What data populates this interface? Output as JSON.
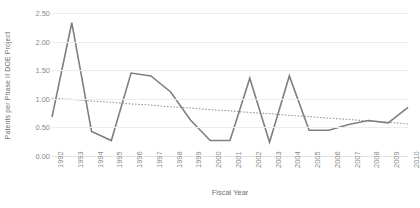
{
  "chart_data": {
    "type": "line",
    "title": "",
    "xlabel": "Fiscal Year",
    "ylabel": "Patents per Phase II DOE Project",
    "ylim": [
      0.0,
      2.5
    ],
    "grid": true,
    "legend": "none",
    "categories": [
      "1992",
      "1993",
      "1994",
      "1995",
      "1996",
      "1997",
      "1998",
      "1999",
      "2000",
      "2001",
      "2002",
      "2003",
      "2004",
      "2005",
      "2006",
      "2007",
      "2008",
      "2009",
      "2010"
    ],
    "ytick_labels": [
      "0.00",
      "0.50",
      "1.00",
      "1.50",
      "2.00",
      "2.50"
    ],
    "ytick_values": [
      0.0,
      0.5,
      1.0,
      1.5,
      2.0,
      2.5
    ],
    "series": [
      {
        "name": "Patents per Phase II DOE Project",
        "style": "solid",
        "color": "#7f7f7f",
        "values": [
          0.68,
          2.33,
          0.43,
          0.27,
          1.45,
          1.4,
          1.12,
          0.63,
          0.27,
          0.27,
          1.36,
          0.24,
          1.4,
          0.45,
          0.45,
          0.55,
          0.62,
          0.58,
          0.85
        ]
      },
      {
        "name": "Linear trendline",
        "style": "dotted",
        "color": "#999999",
        "values": [
          1.01,
          0.99,
          0.96,
          0.94,
          0.91,
          0.89,
          0.86,
          0.84,
          0.81,
          0.79,
          0.76,
          0.74,
          0.71,
          0.69,
          0.66,
          0.64,
          0.61,
          0.59,
          0.56
        ]
      }
    ]
  },
  "axis": {
    "x_title": "Fiscal Year",
    "y_title": "Patents per Phase II DOE Project"
  },
  "caption": {
    "text": ""
  },
  "colors": {
    "series_line": "#7f7f7f",
    "trendline": "#999999",
    "gridline": "#ededed",
    "tick_text": "#8a8a8a",
    "title_text": "#6f6f6f"
  }
}
